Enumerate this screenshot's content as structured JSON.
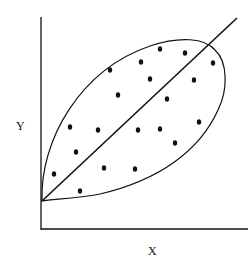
{
  "diagram": {
    "type": "scatter-with-envelope",
    "axes": {
      "x_label": "X",
      "y_label": "Y"
    },
    "colors": {
      "background": "#ffffff",
      "ink": "#111111"
    },
    "elements": {
      "regression_line": {
        "from": [
          42,
          201
        ],
        "to": [
          237,
          18
        ]
      },
      "envelope": "leaf-shaped closed curve around points, apex at origin of line",
      "points": [
        [
          160,
          49
        ],
        [
          185,
          53
        ],
        [
          213,
          63
        ],
        [
          141,
          62
        ],
        [
          110,
          70
        ],
        [
          150,
          79
        ],
        [
          194,
          80
        ],
        [
          118,
          95
        ],
        [
          167,
          99
        ],
        [
          70,
          127
        ],
        [
          98,
          130
        ],
        [
          138,
          130
        ],
        [
          160,
          129
        ],
        [
          199,
          122
        ],
        [
          175,
          143
        ],
        [
          76,
          152
        ],
        [
          104,
          168
        ],
        [
          135,
          169
        ],
        [
          54,
          174
        ],
        [
          80,
          191
        ]
      ]
    }
  }
}
